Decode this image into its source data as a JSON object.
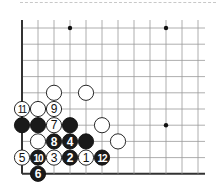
{
  "diagram": {
    "colors": {
      "background": "#ffffff",
      "grid": "#999999",
      "edge": "#333333",
      "black_stone": "#1a1a1a",
      "white_stone": "#ffffff",
      "dashed_separator": "#c8c8c8"
    },
    "grid": {
      "origin_x": 22,
      "origin_y": 28,
      "spacing_x": 16.0,
      "spacing_y": 16.2,
      "cols": 12,
      "rows": 10,
      "right_extent": 205,
      "left_edge": true,
      "bottom_edge": true
    },
    "hoshi": [
      {
        "col": 3,
        "row": 0
      },
      {
        "col": 9,
        "row": 0
      },
      {
        "col": 9,
        "row": 6
      }
    ],
    "stones": [
      {
        "col": 2,
        "row": 4,
        "color": "white",
        "label": ""
      },
      {
        "col": 4,
        "row": 4,
        "color": "white",
        "label": ""
      },
      {
        "col": 0,
        "row": 5,
        "color": "white",
        "label": "11"
      },
      {
        "col": 1,
        "row": 5,
        "color": "white",
        "label": ""
      },
      {
        "col": 2,
        "row": 5,
        "color": "white",
        "label": "9"
      },
      {
        "col": 0,
        "row": 6,
        "color": "black",
        "label": ""
      },
      {
        "col": 1,
        "row": 6,
        "color": "black",
        "label": ""
      },
      {
        "col": 2,
        "row": 6,
        "color": "white",
        "label": "7"
      },
      {
        "col": 3,
        "row": 6,
        "color": "black",
        "label": ""
      },
      {
        "col": 5,
        "row": 6,
        "color": "white",
        "label": ""
      },
      {
        "col": 1,
        "row": 7,
        "color": "white",
        "label": ""
      },
      {
        "col": 2,
        "row": 7,
        "color": "black",
        "label": "8"
      },
      {
        "col": 3,
        "row": 7,
        "color": "black",
        "label": "4"
      },
      {
        "col": 4,
        "row": 7,
        "color": "black",
        "label": ""
      },
      {
        "col": 6,
        "row": 7,
        "color": "white",
        "label": ""
      },
      {
        "col": 0,
        "row": 8,
        "color": "white",
        "label": "5"
      },
      {
        "col": 1,
        "row": 8,
        "color": "black",
        "label": "10"
      },
      {
        "col": 2,
        "row": 8,
        "color": "white",
        "label": "3"
      },
      {
        "col": 3,
        "row": 8,
        "color": "black",
        "label": "2"
      },
      {
        "col": 4,
        "row": 8,
        "color": "white",
        "label": "1"
      },
      {
        "col": 5,
        "row": 8,
        "color": "black",
        "label": "12"
      },
      {
        "col": 1,
        "row": 9,
        "color": "black",
        "label": "6"
      }
    ]
  }
}
